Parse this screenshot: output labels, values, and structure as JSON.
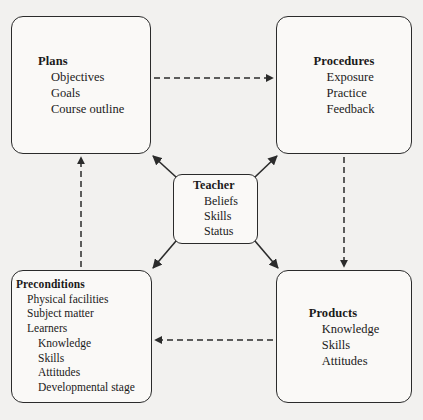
{
  "diagram": {
    "background_color": "#f2f1ef",
    "box_fill": "#faf9f7",
    "line_color": "#2b2b2b",
    "nodes": {
      "plans": {
        "title": "Plans",
        "items": [
          "Objectives",
          "Goals",
          "Course outline"
        ]
      },
      "procedures": {
        "title": "Procedures",
        "items": [
          "Exposure",
          "Practice",
          "Feedback"
        ]
      },
      "teacher": {
        "title": "Teacher",
        "items": [
          "Beliefs",
          "Skills",
          "Status"
        ]
      },
      "preconditions": {
        "title": "Preconditions",
        "items": [
          {
            "label": "Physical facilities",
            "level": 1
          },
          {
            "label": "Subject matter",
            "level": 1
          },
          {
            "label": "Learners",
            "level": 1
          },
          {
            "label": "Knowledge",
            "level": 2
          },
          {
            "label": "Skills",
            "level": 2
          },
          {
            "label": "Attitudes",
            "level": 2
          },
          {
            "label": "Developmental stage",
            "level": 2
          }
        ]
      },
      "products": {
        "title": "Products",
        "items": [
          "Knowledge",
          "Skills",
          "Attitudes"
        ]
      }
    },
    "connectors": [
      {
        "name": "plans-to-procedures",
        "style": "dashed",
        "from": "plans",
        "to": "procedures",
        "direction": "right"
      },
      {
        "name": "procedures-to-products",
        "style": "dashed",
        "from": "procedures",
        "to": "products",
        "direction": "down"
      },
      {
        "name": "products-to-preconditions",
        "style": "dashed",
        "from": "products",
        "to": "preconditions",
        "direction": "left"
      },
      {
        "name": "preconditions-to-plans",
        "style": "dashed",
        "from": "preconditions",
        "to": "plans",
        "direction": "up"
      },
      {
        "name": "teacher-to-plans",
        "style": "solid",
        "from": "teacher",
        "to": "plans",
        "direction": "up-left"
      },
      {
        "name": "teacher-to-procedures",
        "style": "solid",
        "from": "teacher",
        "to": "procedures",
        "direction": "up-right"
      },
      {
        "name": "teacher-to-preconditions",
        "style": "solid",
        "from": "teacher",
        "to": "preconditions",
        "direction": "down-left"
      },
      {
        "name": "teacher-to-products",
        "style": "solid",
        "from": "teacher",
        "to": "products",
        "direction": "down-right"
      }
    ]
  }
}
